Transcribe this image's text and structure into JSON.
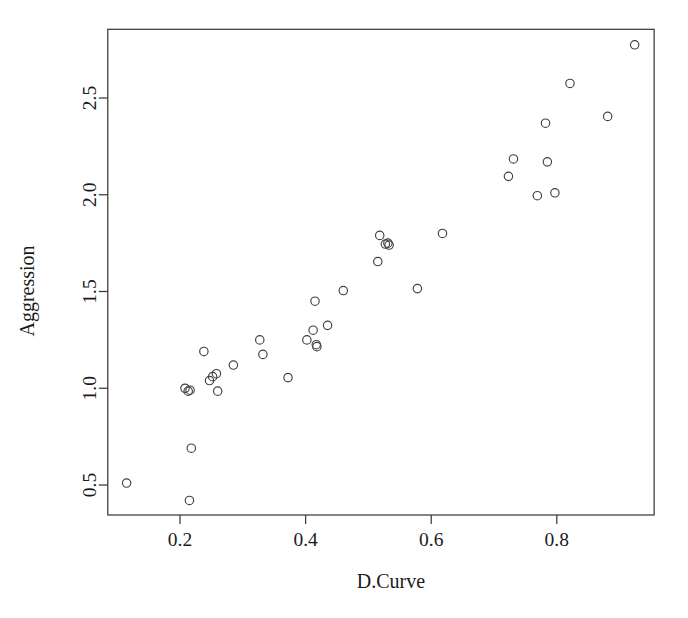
{
  "chart_data": {
    "type": "scatter",
    "title": "",
    "xlabel": "D.Curve",
    "ylabel": "Aggression",
    "xlim": [
      0.085,
      0.955
    ],
    "ylim": [
      0.345,
      2.855
    ],
    "xticks": [
      0.2,
      0.4,
      0.6,
      0.8
    ],
    "xtick_labels": [
      "0.2",
      "0.4",
      "0.6",
      "0.8"
    ],
    "yticks": [
      0.5,
      1.0,
      1.5,
      2.0,
      2.5
    ],
    "ytick_labels": [
      "0.5",
      "1.0",
      "1.5",
      "2.0",
      "2.5"
    ],
    "grid": false,
    "legend": null,
    "marker": "open-circle",
    "marker_color": "#404040",
    "n_points": 38,
    "points": [
      {
        "x": 0.115,
        "y": 0.51
      },
      {
        "x": 0.215,
        "y": 0.42
      },
      {
        "x": 0.218,
        "y": 0.69
      },
      {
        "x": 0.208,
        "y": 1.0
      },
      {
        "x": 0.213,
        "y": 0.985
      },
      {
        "x": 0.216,
        "y": 0.99
      },
      {
        "x": 0.238,
        "y": 1.19
      },
      {
        "x": 0.247,
        "y": 1.04
      },
      {
        "x": 0.252,
        "y": 1.06
      },
      {
        "x": 0.258,
        "y": 1.075
      },
      {
        "x": 0.26,
        "y": 0.985
      },
      {
        "x": 0.285,
        "y": 1.12
      },
      {
        "x": 0.327,
        "y": 1.25
      },
      {
        "x": 0.332,
        "y": 1.175
      },
      {
        "x": 0.372,
        "y": 1.055
      },
      {
        "x": 0.402,
        "y": 1.25
      },
      {
        "x": 0.412,
        "y": 1.3
      },
      {
        "x": 0.415,
        "y": 1.45
      },
      {
        "x": 0.417,
        "y": 1.225
      },
      {
        "x": 0.418,
        "y": 1.215
      },
      {
        "x": 0.435,
        "y": 1.325
      },
      {
        "x": 0.46,
        "y": 1.505
      },
      {
        "x": 0.515,
        "y": 1.655
      },
      {
        "x": 0.518,
        "y": 1.79
      },
      {
        "x": 0.527,
        "y": 1.745
      },
      {
        "x": 0.531,
        "y": 1.75
      },
      {
        "x": 0.533,
        "y": 1.74
      },
      {
        "x": 0.578,
        "y": 1.515
      },
      {
        "x": 0.618,
        "y": 1.8
      },
      {
        "x": 0.723,
        "y": 2.095
      },
      {
        "x": 0.731,
        "y": 2.185
      },
      {
        "x": 0.769,
        "y": 1.995
      },
      {
        "x": 0.782,
        "y": 2.37
      },
      {
        "x": 0.785,
        "y": 2.17
      },
      {
        "x": 0.797,
        "y": 2.01
      },
      {
        "x": 0.821,
        "y": 2.575
      },
      {
        "x": 0.881,
        "y": 2.405
      },
      {
        "x": 0.924,
        "y": 2.775
      }
    ]
  },
  "figure": {
    "background": "#ffffff",
    "frame_color": "#3a3a3a",
    "text_color": "#1a1a1a",
    "point_color": "#404040"
  }
}
